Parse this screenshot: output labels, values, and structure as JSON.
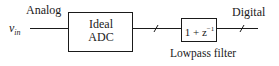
{
  "diagram": {
    "input_label": "Analog",
    "input_signal": {
      "base": "v",
      "subscript": "in"
    },
    "adc_block": {
      "line1": "Ideal",
      "line2": "ADC"
    },
    "filter_block": {
      "expression_base": "1 + z",
      "expression_exp": "−1",
      "caption": "Lowpass filter"
    },
    "output_label": "Digital",
    "colors": {
      "stroke": "#1a1a1a",
      "background": "#ffffff"
    }
  }
}
